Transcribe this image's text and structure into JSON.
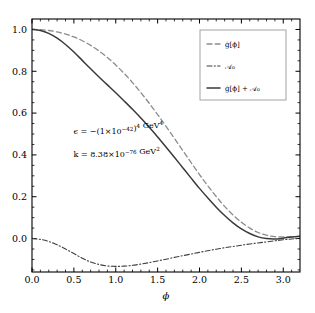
{
  "figure": {
    "background_color": "#ffffff",
    "frame_color": "#000000"
  },
  "chart_data": {
    "type": "line",
    "title": "",
    "xlabel": "ϕ",
    "ylabel": "",
    "xlim": [
      0.0,
      3.2
    ],
    "ylim": [
      -0.16,
      1.05
    ],
    "grid": false,
    "legend_position": "upper right",
    "xticks": [
      "0.0",
      "0.5",
      "1.0",
      "1.5",
      "2.0",
      "2.5",
      "3.0"
    ],
    "xtick_values": [
      0.0,
      0.5,
      1.0,
      1.5,
      2.0,
      2.5,
      3.0
    ],
    "yticks": [
      "0.0",
      "0.2",
      "0.4",
      "0.6",
      "0.8",
      "1.0"
    ],
    "ytick_values": [
      0.0,
      0.2,
      0.4,
      0.6,
      0.8,
      1.0
    ],
    "x": [
      0.0,
      0.1,
      0.2,
      0.3,
      0.4,
      0.5,
      0.6,
      0.7,
      0.8,
      0.9,
      1.0,
      1.1,
      1.2,
      1.3,
      1.4,
      1.5,
      1.6,
      1.7,
      1.8,
      1.9,
      2.0,
      2.1,
      2.2,
      2.3,
      2.4,
      2.5,
      2.6,
      2.7,
      2.8,
      2.9,
      3.0,
      3.1,
      3.2
    ],
    "series": [
      {
        "name": "g_dot_phi",
        "legend_label": "ġ[ϕ]",
        "style": "dashed",
        "color": "#8c8c8c",
        "width": 1.3,
        "values": [
          1.0,
          0.999,
          0.995,
          0.988,
          0.978,
          0.964,
          0.946,
          0.924,
          0.897,
          0.866,
          0.83,
          0.79,
          0.746,
          0.698,
          0.647,
          0.593,
          0.537,
          0.479,
          0.421,
          0.363,
          0.306,
          0.252,
          0.201,
          0.154,
          0.113,
          0.078,
          0.05,
          0.029,
          0.016,
          0.009,
          0.008,
          0.009,
          0.01
        ]
      },
      {
        "name": "A_0",
        "legend_label": "𝒜₀",
        "style": "dashdot",
        "color": "#3f3f3f",
        "width": 1.1,
        "values": [
          0.0,
          -0.004,
          -0.014,
          -0.03,
          -0.05,
          -0.072,
          -0.094,
          -0.112,
          -0.124,
          -0.131,
          -0.133,
          -0.132,
          -0.128,
          -0.122,
          -0.115,
          -0.107,
          -0.099,
          -0.09,
          -0.082,
          -0.074,
          -0.066,
          -0.058,
          -0.051,
          -0.044,
          -0.038,
          -0.032,
          -0.026,
          -0.021,
          -0.016,
          -0.011,
          -0.006,
          -0.002,
          0.001
        ]
      },
      {
        "name": "g_dot_phi_plus_A_0",
        "legend_label": "ġ[ϕ] + 𝒜₀",
        "style": "solid",
        "color": "#3a3a3a",
        "width": 1.5,
        "values": [
          1.0,
          0.995,
          0.981,
          0.958,
          0.928,
          0.892,
          0.852,
          0.812,
          0.773,
          0.735,
          0.697,
          0.658,
          0.618,
          0.576,
          0.532,
          0.486,
          0.438,
          0.389,
          0.339,
          0.289,
          0.24,
          0.194,
          0.15,
          0.11,
          0.075,
          0.046,
          0.024,
          0.008,
          0.0,
          -0.002,
          0.002,
          0.007,
          0.011
        ]
      }
    ],
    "annotations": [
      {
        "name": "epsilon-annotation",
        "x_frac": 0.155,
        "y_frac": 0.455,
        "parts": [
          {
            "t": "ϵ = −(1×10",
            "k": "base"
          },
          {
            "t": "−42",
            "k": "sup"
          },
          {
            "t": ")",
            "k": "base"
          },
          {
            "t": "4",
            "k": "sup"
          },
          {
            "t": " GeV",
            "k": "base"
          },
          {
            "t": "4",
            "k": "sup"
          }
        ],
        "plain": "ϵ = −(1×10⁻⁴²)⁴ GeV⁴"
      },
      {
        "name": "k-annotation",
        "x_frac": 0.155,
        "y_frac": 0.545,
        "parts": [
          {
            "t": "k = 8.38×10",
            "k": "base"
          },
          {
            "t": "−76",
            "k": "sup"
          },
          {
            "t": " GeV",
            "k": "base"
          },
          {
            "t": "2",
            "k": "sup"
          }
        ],
        "plain": "k = 8.38×10⁻⁷⁶ GeV²"
      }
    ]
  }
}
